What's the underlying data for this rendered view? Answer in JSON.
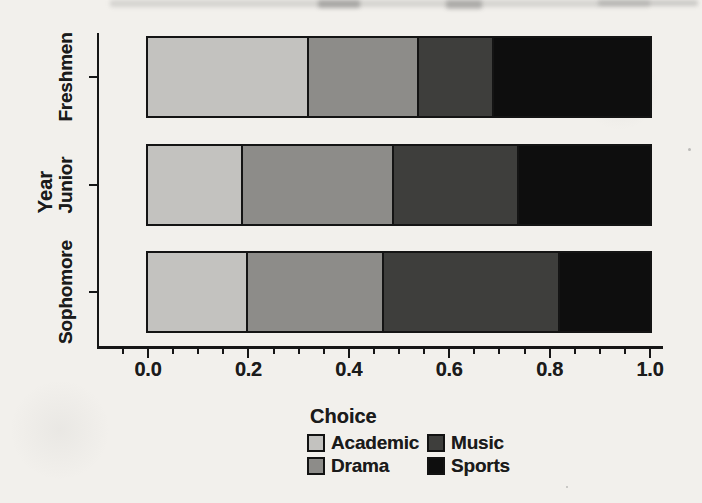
{
  "figure": {
    "kind": "scanned stacked bar chart figure",
    "paper_color": "#f2f0ec",
    "ink_color": "#1b1b1b"
  },
  "chart_data": {
    "type": "bar",
    "orientation": "horizontal",
    "stacked": true,
    "normalized": true,
    "title": "",
    "xlabel": "",
    "ylabel": "Year",
    "categories": [
      "Freshmen",
      "Junior",
      "Sophomore"
    ],
    "series": [
      {
        "name": "Academic",
        "color": "#c3c2bf",
        "values": [
          0.32,
          0.19,
          0.2
        ]
      },
      {
        "name": "Drama",
        "color": "#8d8c89",
        "values": [
          0.22,
          0.3,
          0.27
        ]
      },
      {
        "name": "Music",
        "color": "#3e3e3c",
        "values": [
          0.15,
          0.25,
          0.35
        ]
      },
      {
        "name": "Sports",
        "color": "#0e0e0e",
        "values": [
          0.31,
          0.26,
          0.18
        ]
      }
    ],
    "xlim": [
      0.0,
      1.0
    ],
    "x_tick_labels": [
      "0.0",
      "0.2",
      "0.4",
      "0.6",
      "0.8",
      "1.0"
    ],
    "x_major_tick_step": 0.2,
    "x_minor_tick_step": 0.05,
    "grid": false,
    "legend": {
      "title": "Choice",
      "position": "bottom",
      "columns": 2,
      "column_order": [
        [
          "Academic",
          "Drama"
        ],
        [
          "Music",
          "Sports"
        ]
      ]
    }
  }
}
